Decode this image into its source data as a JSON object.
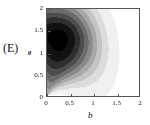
{
  "panel": {
    "label": "(E)"
  },
  "chart_data": {
    "type": "heatmap",
    "title": "",
    "subtitle": "",
    "xlabel": "b",
    "ylabel": "g",
    "xlim": [
      0,
      2
    ],
    "ylim": [
      0,
      2
    ],
    "xticks": [
      0,
      0.5,
      1,
      1.5,
      2
    ],
    "xticklabels": [
      "0",
      "0.5",
      "1",
      "1.5",
      "2"
    ],
    "yticks": [
      0,
      0.5,
      1,
      1.5,
      2
    ],
    "yticklabels": [
      "0",
      "0.5",
      "1",
      "1.5",
      "2"
    ],
    "grid": false,
    "legend": null,
    "colormap": "grayscale-reversed",
    "contour_levels": [
      0.05,
      0.15,
      0.25,
      0.35,
      0.45,
      0.55,
      0.65,
      0.75,
      0.85,
      0.95
    ],
    "level_colors": [
      "#ffffff",
      "#f0f0f0",
      "#dcdcdc",
      "#c4c4c4",
      "#a8a8a8",
      "#8a8a8a",
      "#6b6b6b",
      "#4d4d4d",
      "#2e2e2e",
      "#121212",
      "#000000"
    ],
    "peak": {
      "b": 0.32,
      "g": 1.32,
      "value": 1.0
    },
    "field": {
      "note": "Sampled density values on a 9x9 grid over b in [0,2], g in [0,2]; rows listed from g=2 (top) down to g=0 (bottom).",
      "b_samples": [
        0,
        0.25,
        0.5,
        0.75,
        1.0,
        1.25,
        1.5,
        1.75,
        2.0
      ],
      "g_samples": [
        2.0,
        1.75,
        1.5,
        1.25,
        1.0,
        0.75,
        0.5,
        0.25,
        0.0
      ],
      "values": [
        [
          0.62,
          0.8,
          0.6,
          0.3,
          0.1,
          0.02,
          0.0,
          0.0,
          0.0
        ],
        [
          0.78,
          0.95,
          0.72,
          0.38,
          0.14,
          0.03,
          0.0,
          0.0,
          0.0
        ],
        [
          0.86,
          1.0,
          0.8,
          0.44,
          0.17,
          0.04,
          0.0,
          0.0,
          0.0
        ],
        [
          0.84,
          0.97,
          0.78,
          0.45,
          0.19,
          0.05,
          0.01,
          0.0,
          0.0
        ],
        [
          0.72,
          0.86,
          0.7,
          0.43,
          0.19,
          0.05,
          0.01,
          0.0,
          0.0
        ],
        [
          0.55,
          0.68,
          0.58,
          0.37,
          0.18,
          0.05,
          0.01,
          0.0,
          0.0
        ],
        [
          0.36,
          0.47,
          0.42,
          0.29,
          0.15,
          0.05,
          0.01,
          0.0,
          0.0
        ],
        [
          0.18,
          0.26,
          0.25,
          0.19,
          0.11,
          0.04,
          0.01,
          0.0,
          0.0
        ],
        [
          0.04,
          0.08,
          0.09,
          0.08,
          0.05,
          0.02,
          0.0,
          0.0,
          0.0
        ]
      ]
    }
  }
}
